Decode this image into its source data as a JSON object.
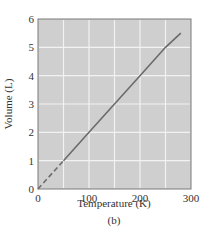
{
  "chart_data": {
    "type": "line",
    "title": "",
    "caption": "(b)",
    "xlabel": "Temperature (K)",
    "ylabel": "Volume (L)",
    "xlim": [
      0,
      300
    ],
    "ylim": [
      0,
      6
    ],
    "x_ticks": [
      0,
      100,
      200,
      300
    ],
    "y_ticks": [
      0,
      1,
      2,
      3,
      4,
      5,
      6
    ],
    "x_grid_step": 50,
    "y_grid_step": 1,
    "grid": true,
    "legend": null,
    "series": [
      {
        "name": "Volume vs Temperature (extrapolated)",
        "style": "dashed",
        "x": [
          0,
          50
        ],
        "y": [
          0,
          1.0
        ]
      },
      {
        "name": "Volume vs Temperature (measured)",
        "style": "solid",
        "x": [
          50,
          100,
          150,
          200,
          250,
          280
        ],
        "y": [
          1.0,
          2.0,
          3.0,
          4.0,
          5.0,
          5.5
        ]
      }
    ],
    "colors": {
      "plot_bg": "#cfcfcf",
      "grid": "#f2f2f2",
      "line": "#6b6b6b",
      "frame": "#7a7a7a"
    }
  }
}
